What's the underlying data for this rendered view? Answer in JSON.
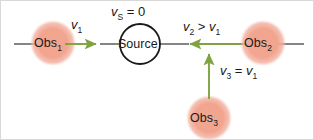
{
  "figure": {
    "type": "physics-diagram",
    "topic": "doppler-effect-stationary-source-moving-observers",
    "width": 314,
    "height": 140,
    "background_color": "#ffffff",
    "border_color": "#d8d8d8"
  },
  "colors": {
    "observer_fill": "#f0a58e",
    "observer_fill_inner": "#f3ad98",
    "source_stroke": "#1a1a1a",
    "source_fill": "#ffffff",
    "axis_line": "#6d6f74",
    "velocity_arrow": "#7fa33f",
    "text": "#1a1a1a"
  },
  "nodes": [
    {
      "id": "obs1",
      "name": "observer-1",
      "label": "Obs",
      "sub": "1",
      "shape": "circle-soft",
      "cx": 52,
      "cy": 42,
      "r": 23
    },
    {
      "id": "source",
      "name": "sound-source",
      "label": "Source",
      "sub": "",
      "shape": "circle-outline",
      "cx": 139,
      "cy": 43,
      "r": 20
    },
    {
      "id": "obs2",
      "name": "observer-2",
      "label": "Obs",
      "sub": "2",
      "shape": "circle-soft",
      "cx": 262,
      "cy": 42,
      "r": 23
    },
    {
      "id": "obs3",
      "name": "observer-3",
      "label": "Obs",
      "sub": "3",
      "shape": "circle-soft",
      "cx": 208,
      "cy": 117,
      "r": 23
    }
  ],
  "labels": {
    "source_velocity": {
      "var": "v",
      "sub": "S",
      "op": " = ",
      "value": "0",
      "x": 110,
      "y": 2
    },
    "v1": {
      "var": "v",
      "sub": "1",
      "op": "",
      "value": "",
      "x": 70,
      "y": 15
    },
    "v2_gt_v1": {
      "var": "v",
      "sub": "2",
      "op": " > ",
      "value2": "v",
      "sub2": "1",
      "x": 182,
      "y": 17
    },
    "v3_eq_v1": {
      "var": "v",
      "sub": "3",
      "op": " = ",
      "value2": "v",
      "sub2": "1",
      "x": 219,
      "y": 61
    }
  },
  "arrows": [
    {
      "id": "arrow-v1",
      "name": "velocity-arrow-obs1",
      "direction": "right",
      "x1": 64,
      "y1": 43,
      "x2": 99,
      "y2": 43,
      "label": "v1",
      "meaning": "Obs1 moves toward the source"
    },
    {
      "id": "arrow-v2",
      "name": "velocity-arrow-obs2",
      "direction": "left",
      "x1": 240,
      "y1": 43,
      "x2": 185,
      "y2": 43,
      "label": "v2 > v1",
      "meaning": "Obs2 moves toward the source faster"
    },
    {
      "id": "arrow-v3",
      "name": "velocity-arrow-obs3",
      "direction": "up",
      "x1": 208,
      "y1": 98,
      "x2": 208,
      "y2": 50,
      "label": "v3 = v1",
      "meaning": "Obs3 moves upward toward the axis"
    }
  ],
  "axis": {
    "name": "horizontal-axis",
    "y": 43,
    "segments": [
      {
        "x1": 13,
        "x2": 40
      },
      {
        "x1": 99,
        "x2": 120
      },
      {
        "x1": 158,
        "x2": 186
      },
      {
        "x1": 240,
        "x2": 248
      },
      {
        "x1": 276,
        "x2": 303
      }
    ]
  }
}
